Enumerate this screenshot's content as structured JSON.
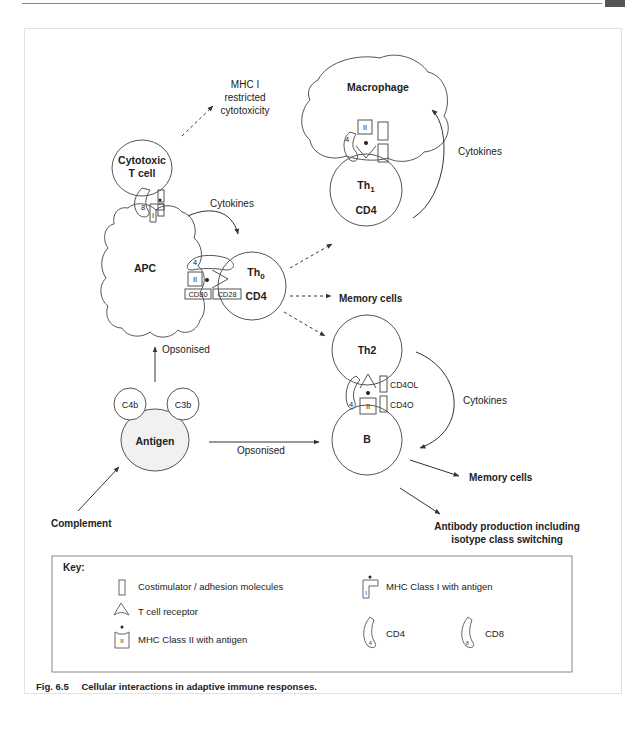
{
  "header": {
    "running_title": "IMMUNOLOGY"
  },
  "cells": {
    "cytotoxic": {
      "line1": "Cytotoxic",
      "line2": "T cell"
    },
    "apc": "APC",
    "th0": {
      "name": "Th",
      "sub": "0",
      "marker": "CD4"
    },
    "macrophage": "Macrophage",
    "th1": {
      "name": "Th",
      "sub": "1",
      "marker": "CD4"
    },
    "th2": "Th2",
    "b": "B",
    "antigen": "Antigen",
    "c4b": "C4b",
    "c3b": "C3b"
  },
  "molecules": {
    "cd80": "CD80",
    "cd28": "CD28",
    "cd4ol": "CD4OL",
    "cd4o": "CD4O",
    "mhc2": "II",
    "mhc1": "I",
    "cd4_num": "4",
    "cd8_num": "8"
  },
  "labels": {
    "mhc1_restricted": [
      "MHC I",
      "restricted",
      "cytotoxicity"
    ],
    "cytokines_apc": "Cytokines",
    "cytokines_mac": "Cytokines",
    "cytokines_th2": "Cytokines",
    "memory_cells_1": "Memory cells",
    "memory_cells_2": "Memory cells",
    "opsonised_up": "Opsonised",
    "opsonised_right": "Opsonised",
    "complement": "Complement",
    "antibody": [
      "Antibody production including",
      "isotype class switching"
    ]
  },
  "key": {
    "title": "Key:",
    "items": [
      {
        "icon": "costimulator-icon",
        "label": "Costimulator / adhesion molecules"
      },
      {
        "icon": "t-cell-receptor-icon",
        "label": "T cell receptor"
      },
      {
        "icon": "mhc-class-ii-icon",
        "label": "MHC Class II with antigen"
      },
      {
        "icon": "mhc-class-i-icon",
        "label": "MHC Class I with antigen"
      },
      {
        "icon": "cd4-icon",
        "label": "CD4"
      },
      {
        "icon": "cd8-icon",
        "label": "CD8"
      }
    ]
  },
  "caption": {
    "fig": "Fig. 6.5",
    "text": "Cellular interactions in adaptive immune responses."
  },
  "colors": {
    "stroke": "#555555",
    "text": "#222222",
    "antigen_fill": "#f1f1f1"
  }
}
